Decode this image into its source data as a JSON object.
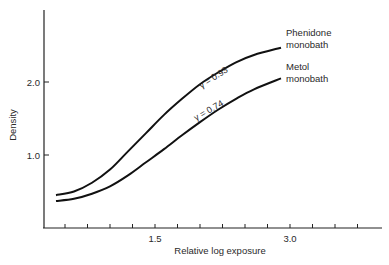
{
  "chart_data": {
    "type": "line",
    "title": "",
    "xlabel": "Relative log exposure",
    "ylabel": "Density",
    "xlim": [
      0.3,
      4.1
    ],
    "ylim": [
      0,
      3.1
    ],
    "x_ticks": [
      0.5,
      0.75,
      1.0,
      1.25,
      1.5,
      1.75,
      2.0,
      2.25,
      2.5,
      2.75,
      3.0,
      3.25,
      3.5,
      3.75
    ],
    "x_tick_labels": {
      "1.5": "1.5",
      "3.0": "3.0"
    },
    "y_ticks": [
      1.0,
      2.0
    ],
    "y_tick_labels": [
      "1.0",
      "2.0"
    ],
    "grid": false,
    "legend": "inline labels at curve ends",
    "series": [
      {
        "name": "Phenidone monobath",
        "label_lines": [
          "Phenidone",
          "monobath"
        ],
        "annotation": "γ = 0.93",
        "x": [
          0.4,
          0.6,
          0.8,
          1.0,
          1.2,
          1.4,
          1.6,
          1.8,
          2.0,
          2.2,
          2.4,
          2.6,
          2.9
        ],
        "y": [
          0.45,
          0.5,
          0.62,
          0.8,
          1.05,
          1.3,
          1.55,
          1.77,
          1.97,
          2.13,
          2.27,
          2.37,
          2.47
        ]
      },
      {
        "name": "Metol monobath",
        "label_lines": [
          "Metol",
          "monobath"
        ],
        "annotation": "γ = 0.74",
        "x": [
          0.4,
          0.6,
          0.8,
          1.0,
          1.2,
          1.4,
          1.6,
          1.8,
          2.0,
          2.2,
          2.4,
          2.6,
          2.9
        ],
        "y": [
          0.37,
          0.4,
          0.47,
          0.57,
          0.72,
          0.9,
          1.08,
          1.27,
          1.45,
          1.62,
          1.77,
          1.9,
          2.05
        ]
      }
    ]
  }
}
